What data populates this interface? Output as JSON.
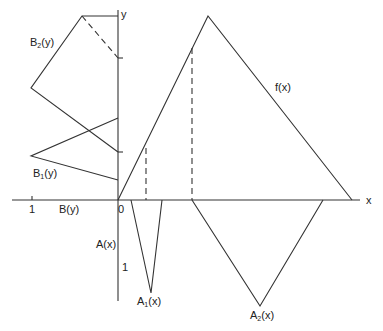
{
  "figure": {
    "axes": {
      "x_label": "x",
      "y_label": "y",
      "origin_label": "0",
      "b_axis_tick_label": "1",
      "b_axis_label": "B(y)",
      "a_axis_label": "A(x)",
      "a_axis_tick_label": "1"
    },
    "curves": {
      "f": {
        "name": "f",
        "arg": "(x)"
      },
      "A1": {
        "name": "A",
        "sub": "1",
        "arg": "(x)"
      },
      "A2": {
        "name": "A",
        "sub": "2",
        "arg": "(x)"
      },
      "B1": {
        "name": "B",
        "sub": "1",
        "arg": "(y)"
      },
      "B2": {
        "name": "B",
        "sub": "2",
        "arg": "(y)"
      }
    },
    "stroke_color": "#333333"
  }
}
